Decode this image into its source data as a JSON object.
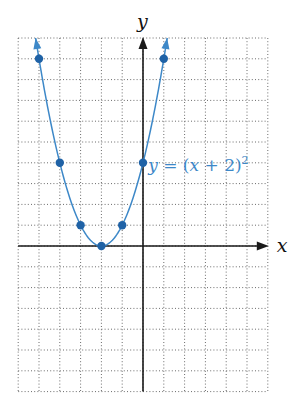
{
  "chart_data": {
    "type": "line",
    "title": "",
    "xlabel": "x",
    "ylabel": "y",
    "xlim": [
      -6,
      6
    ],
    "ylim": [
      -7,
      10
    ],
    "grid": true,
    "grid_style": "dotted",
    "tick_labels_shown": false,
    "series": [
      {
        "name": "y = (x + 2)^2",
        "function": "(x + 2)^2",
        "color": "#3d88c8",
        "arrows_at_ends": true,
        "points": [
          {
            "x": -5,
            "y": 9
          },
          {
            "x": -4,
            "y": 4
          },
          {
            "x": -3,
            "y": 1
          },
          {
            "x": -2,
            "y": 0
          },
          {
            "x": -1,
            "y": 1
          },
          {
            "x": 0,
            "y": 4
          },
          {
            "x": 1,
            "y": 9
          }
        ]
      }
    ],
    "annotations": [
      {
        "text_parts": [
          "y",
          " = (",
          "x",
          " + 2)",
          "2"
        ],
        "anchor": {
          "x": 0.25,
          "y": 3.6
        }
      }
    ]
  },
  "labels": {
    "x_axis": "x",
    "y_axis": "y",
    "equation": {
      "y": "y",
      "eq_open": " = (",
      "x": "x",
      "plus_two": " + 2)",
      "exp": "2"
    }
  },
  "colors": {
    "curve": "#3d88c8",
    "points": "#1f62a6",
    "axis": "#1a1a1a",
    "grid": "#6b6b6b"
  }
}
